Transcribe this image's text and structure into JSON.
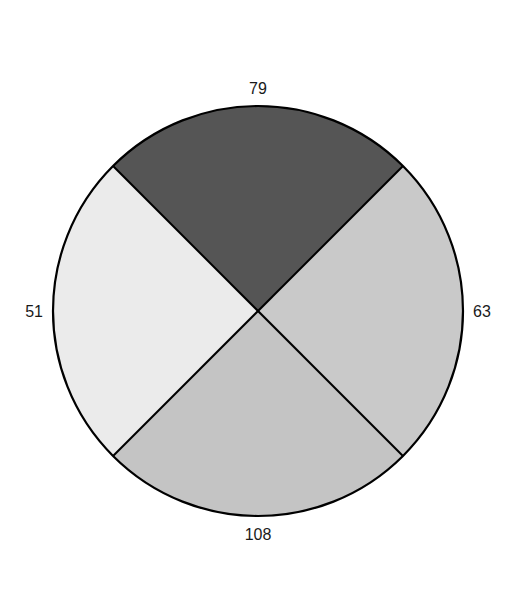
{
  "chart_data": {
    "type": "pie",
    "title": "",
    "center": [
      258,
      311
    ],
    "radius": 205,
    "slices": [
      {
        "position": "top",
        "value": 79,
        "color": "#555555"
      },
      {
        "position": "right",
        "value": 63,
        "color": "#c9c9c9"
      },
      {
        "position": "bottom",
        "value": 108,
        "color": "#c4c4c4"
      },
      {
        "position": "left",
        "value": 51,
        "color": "#ebebeb"
      }
    ],
    "labels": [
      "79",
      "63",
      "108",
      "51"
    ],
    "values": [
      79,
      63,
      108,
      51
    ],
    "categories": [
      "top",
      "right",
      "bottom",
      "left"
    ],
    "equal_angle_sectors": true,
    "outline_color": "#000000",
    "legend": null
  }
}
